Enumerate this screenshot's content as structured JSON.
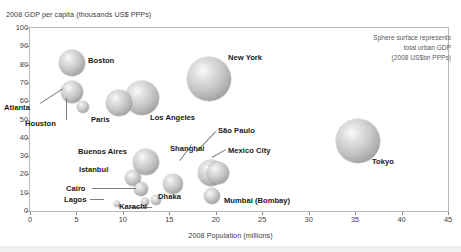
{
  "chart_data": {
    "type": "scatter",
    "title": "",
    "xlabel": "2008 Population (millions)",
    "ylabel": "2008 GDP per capita (thousands US$ PPPs)",
    "xlim": [
      0,
      45
    ],
    "ylim": [
      0,
      100
    ],
    "xticks": [
      0,
      5,
      10,
      15,
      20,
      25,
      30,
      35,
      40,
      45
    ],
    "yticks": [
      0,
      10,
      20,
      30,
      40,
      50,
      60,
      70,
      80,
      90,
      100
    ],
    "grid": false,
    "legend_position": "top-right",
    "size_encoding": "Sphere surface represents total urban GDP (2008 US$bn PPPs)",
    "points": [
      {
        "name": "Boston",
        "x": 4.5,
        "y": 81,
        "r": 13
      },
      {
        "name": "Atlanta",
        "x": 4.5,
        "y": 65,
        "r": 11
      },
      {
        "name": "Houston",
        "x": 5.7,
        "y": 57,
        "r": 6
      },
      {
        "name": "Paris",
        "x": 9.6,
        "y": 59,
        "r": 13
      },
      {
        "name": "Los Angeles",
        "x": 12.1,
        "y": 62,
        "r": 17
      },
      {
        "name": "New York",
        "x": 19.3,
        "y": 72,
        "r": 22
      },
      {
        "name": "Tokyo",
        "x": 35.3,
        "y": 38,
        "r": 22
      },
      {
        "name": "Buenos Aires",
        "x": 12.5,
        "y": 27,
        "r": 13
      },
      {
        "name": "Istanbul",
        "x": 11.1,
        "y": 18,
        "r": 8
      },
      {
        "name": "Shanghai",
        "x": 15.4,
        "y": 15,
        "r": 10
      },
      {
        "name": "Sao Paulo",
        "x": 19.5,
        "y": 21,
        "r": 13
      },
      {
        "name": "Mexico City",
        "x": 20.2,
        "y": 21,
        "r": 11
      },
      {
        "name": "Mumbai (Bombay)",
        "x": 19.6,
        "y": 8,
        "r": 8
      },
      {
        "name": "Cairo",
        "x": 12.0,
        "y": 12,
        "r": 7
      },
      {
        "name": "Dhaka",
        "x": 13.6,
        "y": 6,
        "r": 5
      },
      {
        "name": "Karachi",
        "x": 12.4,
        "y": 5,
        "r": 4
      },
      {
        "name": "Lagos",
        "x": 9.4,
        "y": 4,
        "r": 3
      }
    ]
  },
  "axes": {
    "y_title": "2008 GDP per capita (thousands US$ PPPs)",
    "x_title": "2008 Population (millions)",
    "y_labels": [
      "100",
      "90",
      "80",
      "70",
      "60",
      "50",
      "40",
      "30",
      "20",
      "10",
      "0"
    ],
    "x_labels": [
      "0",
      "5",
      "10",
      "15",
      "20",
      "25",
      "30",
      "35",
      "40",
      "45"
    ]
  },
  "legend": {
    "line1": "Sphere surface represents",
    "line2": "total urban GDP",
    "line3": "(2008 US$bn PPPs)"
  },
  "labels": {
    "boston": "Boston",
    "atlanta": "Atlanta",
    "houston": "Houston",
    "paris": "Paris",
    "los_angeles": "Los Angeles",
    "new_york": "New York",
    "tokyo": "Tokyo",
    "buenos_aires": "Buenos Aires",
    "istanbul": "Istanbul",
    "shanghai": "Shanghai",
    "sao_paulo": "São Paulo",
    "mexico_city": "Mexico City",
    "mumbai": "Mumbai (Bombay)",
    "cairo": "Cairo",
    "dhaka": "Dhaka",
    "karachi": "Karachi",
    "lagos": "Lagos"
  },
  "colors": {
    "frame": "#b9b9b9",
    "text": "#231f20",
    "muted_text": "#5d5a58",
    "bubble_light": "#fbfbfb",
    "bubble_dark": "#7e7e7e",
    "leader": "#7d7d7d"
  }
}
